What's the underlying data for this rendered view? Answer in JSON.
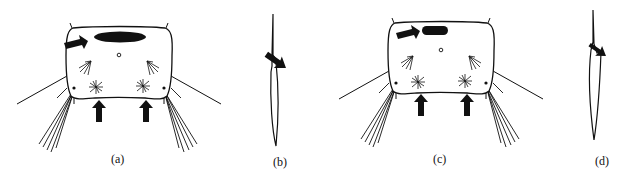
{
  "figure": {
    "panels": [
      {
        "id": "a",
        "label": "(a)",
        "subject": "larval head capsule, dorsal view",
        "arrows": [
          "pointing to dark dorsal patch",
          "pointing to left stellate seta",
          "pointing to right stellate seta"
        ]
      },
      {
        "id": "b",
        "label": "(b)",
        "subject": "seta / spine, lateral view",
        "arrows": [
          "pointing to basal notch"
        ]
      },
      {
        "id": "c",
        "label": "(c)",
        "subject": "larval head capsule, dorsal view (variant)",
        "arrows": [
          "pointing to dark dorsal patch",
          "pointing to left stellate seta",
          "pointing to right stellate seta"
        ]
      },
      {
        "id": "d",
        "label": "(d)",
        "subject": "seta / spine, lateral view (variant)",
        "arrows": [
          "pointing to basal notch"
        ]
      }
    ],
    "colors": {
      "ink": "#111111",
      "background": "#ffffff"
    }
  }
}
